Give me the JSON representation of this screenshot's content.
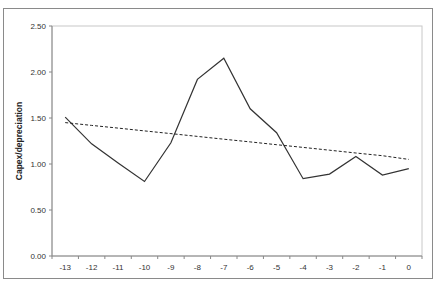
{
  "chart_data": {
    "type": "line",
    "title": "",
    "xlabel": "",
    "ylabel": "Capex/depreciation",
    "categories": [
      "-13",
      "-12",
      "-11",
      "-10",
      "-9",
      "-8",
      "-7",
      "-6",
      "-5",
      "-4",
      "-3",
      "-2",
      "-1",
      "0"
    ],
    "series": [
      {
        "name": "Capex/depreciation",
        "style": "solid",
        "color": "#333333",
        "values": [
          1.51,
          1.22,
          1.01,
          0.81,
          1.23,
          1.92,
          2.15,
          1.6,
          1.34,
          0.84,
          0.89,
          1.08,
          0.88,
          0.95
        ]
      },
      {
        "name": "Linear trend",
        "style": "dashed",
        "color": "#222222",
        "values": [
          1.45,
          1.42,
          1.39,
          1.36,
          1.33,
          1.3,
          1.27,
          1.24,
          1.21,
          1.18,
          1.15,
          1.12,
          1.09,
          1.05
        ]
      }
    ],
    "ylim": [
      0,
      2.5
    ],
    "yticks": [
      "0.00",
      "0.50",
      "1.00",
      "1.50",
      "2.00",
      "2.50"
    ],
    "grid": false,
    "legend": "none"
  }
}
